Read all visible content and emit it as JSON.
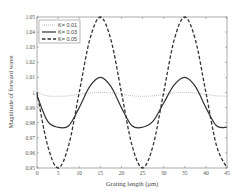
{
  "chart_data": {
    "type": "line",
    "title": "",
    "xlabel": "Grating length (μm)",
    "ylabel": "Magnitude of forward wave",
    "xlim": [
      0,
      45
    ],
    "ylim": [
      0.95,
      1.05
    ],
    "xticks": [
      0,
      5,
      10,
      15,
      20,
      25,
      30,
      35,
      40,
      45
    ],
    "yticks": [
      "0.95",
      "0.96",
      "0.97",
      "0.98",
      "0.99",
      "1",
      "1.01",
      "1.02",
      "1.03",
      "1.04",
      "1.05"
    ],
    "grid": false,
    "legend_position": "upper left",
    "x": [
      0,
      2.5,
      5,
      7.5,
      10,
      12.5,
      15,
      17.5,
      20,
      22.5,
      25,
      27.5,
      30,
      32.5,
      35,
      37.5,
      40,
      42.5,
      45
    ],
    "series": [
      {
        "name": "K= 0.01",
        "style": "dotted",
        "values": [
          1.0,
          0.9978,
          0.9975,
          0.9978,
          0.9988,
          0.9997,
          1.0,
          0.9997,
          0.9988,
          0.9978,
          0.9975,
          0.9978,
          0.9988,
          0.9997,
          1.0,
          0.9997,
          0.9988,
          0.9978,
          0.9975
        ]
      },
      {
        "name": "K= 0.03",
        "style": "solid",
        "values": [
          0.998,
          0.981,
          0.977,
          0.978,
          0.99,
          1.004,
          1.01,
          1.004,
          0.99,
          0.978,
          0.977,
          0.981,
          0.993,
          1.005,
          1.01,
          1.004,
          0.99,
          0.978,
          0.977
        ]
      },
      {
        "name": "K= 0.05",
        "style": "dashed",
        "values": [
          1.0,
          0.965,
          0.95,
          0.965,
          1.0,
          1.035,
          1.05,
          1.035,
          1.0,
          0.965,
          0.95,
          0.965,
          1.0,
          1.035,
          1.05,
          1.035,
          1.0,
          0.965,
          0.95
        ]
      }
    ]
  }
}
